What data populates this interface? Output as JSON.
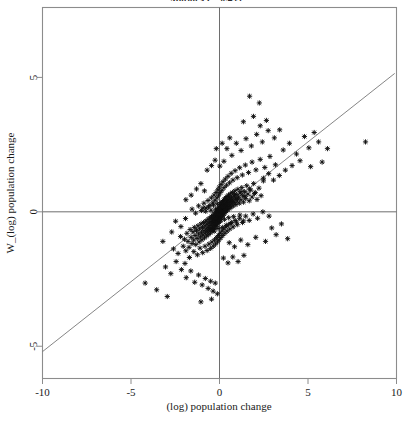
{
  "figure": {
    "title_clipped": "Moran's I = 0.433",
    "background": "#ffffff",
    "frame_color": "#8c8c8c",
    "marker_color": "#101010",
    "line_color": "#777777"
  },
  "chart_data": {
    "type": "scatter",
    "title": "Moran's I = 0.433",
    "xlabel": "(log) population change",
    "ylabel": "W_(log) population change",
    "xlim": [
      -10,
      10
    ],
    "ylim": [
      -6.2,
      7.6
    ],
    "xticks": [
      -10,
      -5,
      0,
      5,
      10
    ],
    "xticklabels": [
      "-10",
      "-5",
      "0",
      "5",
      "10"
    ],
    "yticks": [
      5,
      0,
      -5
    ],
    "yticklabels": [
      "5",
      "0",
      "-5"
    ],
    "grid": false,
    "legend": null,
    "reference_lines": [
      {
        "name": "vertical-zero-line",
        "orientation": "vertical",
        "value": 0
      },
      {
        "name": "horizontal-zero-line",
        "orientation": "horizontal",
        "value": 0
      }
    ],
    "fit_line": {
      "name": "moran-regression-line",
      "slope": 0.52,
      "intercept": 0.0,
      "x_endpoints": [
        -10.2,
        9.9
      ],
      "y_endpoints": [
        -5.3,
        5.15
      ]
    },
    "marker": {
      "style": "asterisk",
      "size": 4
    },
    "n_points": 620,
    "points": [
      [
        -2.6,
        -1.38
      ],
      [
        -2.34,
        -1.55
      ],
      [
        -2.2,
        -0.92
      ],
      [
        -2.05,
        -1.28
      ],
      [
        -1.98,
        -1.02
      ],
      [
        -1.9,
        -1.45
      ],
      [
        -1.84,
        -0.8
      ],
      [
        -1.78,
        -1.1
      ],
      [
        -1.72,
        -1.32
      ],
      [
        -1.66,
        -0.66
      ],
      [
        -1.6,
        -0.95
      ],
      [
        -1.55,
        -1.18
      ],
      [
        -1.5,
        -0.74
      ],
      [
        -1.46,
        -1.05
      ],
      [
        -1.42,
        -0.58
      ],
      [
        -1.38,
        -0.88
      ],
      [
        -1.34,
        -1.22
      ],
      [
        -1.3,
        -0.7
      ],
      [
        -1.26,
        -0.99
      ],
      [
        -1.22,
        -0.52
      ],
      [
        -1.18,
        -0.82
      ],
      [
        -1.15,
        -1.12
      ],
      [
        -1.12,
        -0.64
      ],
      [
        -1.08,
        -0.93
      ],
      [
        -1.05,
        -0.45
      ],
      [
        -1.02,
        -0.76
      ],
      [
        -0.99,
        -1.04
      ],
      [
        -0.96,
        -0.58
      ],
      [
        -0.93,
        -0.86
      ],
      [
        -0.9,
        -0.4
      ],
      [
        -0.88,
        -0.7
      ],
      [
        -0.85,
        -0.97
      ],
      [
        -0.82,
        -0.52
      ],
      [
        -0.8,
        -0.79
      ],
      [
        -0.77,
        -0.34
      ],
      [
        -0.75,
        -0.63
      ],
      [
        -0.72,
        -0.9
      ],
      [
        -0.7,
        -0.46
      ],
      [
        -0.68,
        -0.73
      ],
      [
        -0.65,
        -0.28
      ],
      [
        -0.63,
        -0.57
      ],
      [
        -0.61,
        -0.84
      ],
      [
        -0.59,
        -0.41
      ],
      [
        -0.57,
        -0.67
      ],
      [
        -0.55,
        -0.23
      ],
      [
        -0.53,
        -0.51
      ],
      [
        -0.51,
        -0.78
      ],
      [
        -0.49,
        -0.36
      ],
      [
        -0.47,
        -0.61
      ],
      [
        -0.45,
        -0.18
      ],
      [
        -0.44,
        -0.45
      ],
      [
        -0.42,
        -0.72
      ],
      [
        -0.4,
        -0.31
      ],
      [
        -0.39,
        -0.56
      ],
      [
        -0.37,
        -0.13
      ],
      [
        -0.36,
        -0.4
      ],
      [
        -0.34,
        -0.66
      ],
      [
        -0.33,
        -0.26
      ],
      [
        -0.31,
        -0.5
      ],
      [
        -0.3,
        -0.08
      ],
      [
        -0.29,
        -0.35
      ],
      [
        -0.27,
        -0.6
      ],
      [
        -0.26,
        -0.21
      ],
      [
        -0.25,
        -0.45
      ],
      [
        -0.23,
        -0.03
      ],
      [
        -0.22,
        -0.3
      ],
      [
        -0.21,
        -0.54
      ],
      [
        -0.2,
        -0.16
      ],
      [
        -0.19,
        -0.4
      ],
      [
        -0.17,
        0.02
      ],
      [
        -0.16,
        -0.25
      ],
      [
        -0.15,
        -0.49
      ],
      [
        -0.14,
        -0.11
      ],
      [
        -0.13,
        -0.35
      ],
      [
        -0.12,
        0.07
      ],
      [
        -0.11,
        -0.2
      ],
      [
        -0.1,
        -0.43
      ],
      [
        -0.09,
        -0.06
      ],
      [
        -0.08,
        -0.3
      ],
      [
        -0.07,
        0.12
      ],
      [
        -0.06,
        -0.15
      ],
      [
        -0.05,
        -0.38
      ],
      [
        -0.04,
        -0.01
      ],
      [
        -0.03,
        -0.25
      ],
      [
        -0.02,
        0.17
      ],
      [
        -0.01,
        -0.1
      ],
      [
        0.0,
        -0.33
      ],
      [
        0.01,
        0.04
      ],
      [
        0.02,
        -0.2
      ],
      [
        0.03,
        0.22
      ],
      [
        0.04,
        -0.05
      ],
      [
        0.05,
        -0.28
      ],
      [
        0.06,
        0.09
      ],
      [
        0.07,
        -0.15
      ],
      [
        0.08,
        0.27
      ],
      [
        0.09,
        0.0
      ],
      [
        0.1,
        -0.23
      ],
      [
        0.11,
        0.14
      ],
      [
        0.12,
        -0.1
      ],
      [
        0.13,
        0.32
      ],
      [
        0.14,
        0.05
      ],
      [
        0.15,
        -0.18
      ],
      [
        0.16,
        0.19
      ],
      [
        0.17,
        -0.05
      ],
      [
        0.18,
        0.37
      ],
      [
        0.19,
        0.1
      ],
      [
        0.2,
        -0.13
      ],
      [
        0.21,
        0.24
      ],
      [
        0.22,
        0.0
      ],
      [
        0.23,
        0.42
      ],
      [
        0.24,
        0.15
      ],
      [
        0.25,
        -0.08
      ],
      [
        0.26,
        0.29
      ],
      [
        0.28,
        0.05
      ],
      [
        0.29,
        0.47
      ],
      [
        0.3,
        0.2
      ],
      [
        0.31,
        -0.03
      ],
      [
        0.33,
        0.34
      ],
      [
        0.34,
        0.1
      ],
      [
        0.35,
        0.52
      ],
      [
        0.37,
        0.25
      ],
      [
        0.38,
        0.02
      ],
      [
        0.4,
        0.39
      ],
      [
        0.41,
        0.15
      ],
      [
        0.43,
        0.57
      ],
      [
        0.44,
        0.3
      ],
      [
        0.46,
        0.07
      ],
      [
        0.48,
        0.44
      ],
      [
        0.49,
        0.2
      ],
      [
        0.51,
        0.62
      ],
      [
        0.53,
        0.35
      ],
      [
        0.55,
        0.12
      ],
      [
        0.57,
        0.49
      ],
      [
        0.59,
        0.25
      ],
      [
        0.61,
        0.67
      ],
      [
        0.63,
        0.4
      ],
      [
        0.65,
        0.17
      ],
      [
        0.68,
        0.54
      ],
      [
        0.7,
        0.3
      ],
      [
        0.73,
        0.72
      ],
      [
        0.75,
        0.45
      ],
      [
        0.78,
        0.22
      ],
      [
        0.81,
        0.59
      ],
      [
        0.84,
        0.35
      ],
      [
        0.87,
        0.78
      ],
      [
        0.9,
        0.5
      ],
      [
        0.93,
        0.27
      ],
      [
        0.97,
        0.64
      ],
      [
        1.0,
        0.4
      ],
      [
        1.04,
        0.84
      ],
      [
        1.08,
        0.55
      ],
      [
        1.12,
        0.32
      ],
      [
        1.16,
        0.7
      ],
      [
        1.21,
        0.45
      ],
      [
        1.26,
        0.9
      ],
      [
        1.31,
        0.6
      ],
      [
        1.36,
        0.36
      ],
      [
        1.42,
        0.75
      ],
      [
        1.48,
        0.5
      ],
      [
        1.54,
        0.97
      ],
      [
        1.61,
        0.66
      ],
      [
        1.68,
        0.41
      ],
      [
        1.76,
        0.81
      ],
      [
        1.84,
        0.55
      ],
      [
        1.93,
        1.05
      ],
      [
        2.02,
        0.72
      ],
      [
        2.12,
        0.46
      ],
      [
        2.23,
        0.88
      ],
      [
        2.35,
        0.6
      ],
      [
        2.48,
        1.15
      ],
      [
        -1.95,
        -1.92
      ],
      [
        -1.7,
        -1.7
      ],
      [
        -1.45,
        -1.48
      ],
      [
        -1.25,
        -1.6
      ],
      [
        -1.1,
        -1.35
      ],
      [
        -0.95,
        -1.52
      ],
      [
        -0.82,
        -1.28
      ],
      [
        -0.7,
        -1.44
      ],
      [
        -0.6,
        -1.2
      ],
      [
        -0.5,
        -1.36
      ],
      [
        -0.42,
        -1.12
      ],
      [
        -0.35,
        -1.28
      ],
      [
        -0.28,
        -1.04
      ],
      [
        -0.22,
        -1.2
      ],
      [
        -0.16,
        -0.96
      ],
      [
        -0.11,
        -1.12
      ],
      [
        -0.06,
        -0.88
      ],
      [
        -0.02,
        -1.04
      ],
      [
        0.03,
        -0.8
      ],
      [
        0.08,
        -0.96
      ],
      [
        0.13,
        -0.72
      ],
      [
        0.18,
        -0.88
      ],
      [
        0.24,
        -0.64
      ],
      [
        0.3,
        -0.8
      ],
      [
        0.36,
        -0.56
      ],
      [
        0.43,
        -0.72
      ],
      [
        0.5,
        -0.48
      ],
      [
        0.58,
        -0.64
      ],
      [
        0.67,
        -0.4
      ],
      [
        0.77,
        -0.56
      ],
      [
        0.88,
        -0.32
      ],
      [
        1.0,
        -0.48
      ],
      [
        1.14,
        -0.24
      ],
      [
        1.3,
        -0.4
      ],
      [
        1.48,
        -0.16
      ],
      [
        1.68,
        -0.32
      ],
      [
        1.9,
        -0.08
      ],
      [
        2.15,
        -0.24
      ],
      [
        2.45,
        0.0
      ],
      [
        2.8,
        -0.16
      ],
      [
        -1.55,
        0.1
      ],
      [
        -1.35,
        -0.05
      ],
      [
        -1.18,
        0.22
      ],
      [
        -1.02,
        0.05
      ],
      [
        -0.88,
        0.32
      ],
      [
        -0.76,
        0.14
      ],
      [
        -0.65,
        0.42
      ],
      [
        -0.55,
        0.24
      ],
      [
        -0.46,
        0.52
      ],
      [
        -0.38,
        0.33
      ],
      [
        -0.31,
        0.62
      ],
      [
        -0.25,
        0.43
      ],
      [
        -0.19,
        0.72
      ],
      [
        -0.14,
        0.52
      ],
      [
        -0.09,
        0.82
      ],
      [
        -0.05,
        0.62
      ],
      [
        -0.01,
        0.92
      ],
      [
        0.04,
        0.71
      ],
      [
        0.09,
        1.02
      ],
      [
        0.14,
        0.8
      ],
      [
        0.2,
        1.12
      ],
      [
        0.26,
        0.9
      ],
      [
        0.33,
        1.22
      ],
      [
        0.4,
        0.99
      ],
      [
        0.48,
        1.32
      ],
      [
        0.57,
        1.08
      ],
      [
        0.66,
        1.43
      ],
      [
        0.76,
        1.18
      ],
      [
        0.88,
        1.53
      ],
      [
        1.0,
        1.27
      ],
      [
        1.14,
        1.64
      ],
      [
        1.29,
        1.37
      ],
      [
        1.46,
        1.74
      ],
      [
        1.64,
        1.46
      ],
      [
        1.84,
        1.85
      ],
      [
        2.06,
        1.56
      ],
      [
        2.3,
        1.95
      ],
      [
        2.56,
        1.65
      ],
      [
        2.85,
        2.06
      ],
      [
        3.16,
        1.75
      ],
      [
        0.42,
        2.35
      ],
      [
        0.7,
        2.1
      ],
      [
        0.95,
        2.55
      ],
      [
        1.22,
        2.28
      ],
      [
        1.5,
        2.72
      ],
      [
        1.8,
        2.45
      ],
      [
        2.1,
        2.88
      ],
      [
        2.42,
        2.6
      ],
      [
        2.75,
        3.02
      ],
      [
        3.1,
        2.75
      ],
      [
        1.35,
        3.35
      ],
      [
        1.92,
        3.55
      ],
      [
        2.3,
        3.2
      ],
      [
        2.65,
        3.4
      ],
      [
        3.4,
        3.05
      ],
      [
        1.7,
        4.3
      ],
      [
        2.25,
        4.05
      ],
      [
        3.6,
        2.3
      ],
      [
        3.95,
        2.55
      ],
      [
        4.35,
        2.15
      ],
      [
        5.05,
        2.38
      ],
      [
        5.6,
        2.6
      ],
      [
        8.25,
        2.6
      ],
      [
        -3.05,
        -2.05
      ],
      [
        -2.75,
        -2.3
      ],
      [
        -2.45,
        -1.85
      ],
      [
        -2.15,
        -2.15
      ],
      [
        -1.88,
        -2.45
      ],
      [
        -1.62,
        -2.2
      ],
      [
        -1.4,
        -2.62
      ],
      [
        -1.18,
        -2.35
      ],
      [
        -0.98,
        -2.72
      ],
      [
        -0.8,
        -2.48
      ],
      [
        -0.64,
        -2.85
      ],
      [
        -0.5,
        -2.58
      ],
      [
        -0.36,
        -2.95
      ],
      [
        -0.24,
        -2.65
      ],
      [
        -0.12,
        -3.05
      ],
      [
        0.22,
        -1.72
      ],
      [
        0.48,
        -1.9
      ],
      [
        0.75,
        -1.68
      ],
      [
        1.05,
        -1.85
      ],
      [
        1.38,
        -1.62
      ],
      [
        -4.2,
        -2.65
      ],
      [
        -3.55,
        -2.9
      ],
      [
        -2.95,
        -3.15
      ],
      [
        -1.05,
        -3.35
      ],
      [
        -0.45,
        -3.25
      ],
      [
        0.55,
        -1.15
      ],
      [
        0.85,
        -1.3
      ],
      [
        1.2,
        -1.05
      ],
      [
        1.6,
        -1.22
      ],
      [
        2.05,
        -0.95
      ],
      [
        2.6,
        -1.1
      ],
      [
        3.2,
        -0.85
      ],
      [
        3.85,
        -1.0
      ],
      [
        2.95,
        -0.6
      ],
      [
        3.5,
        -0.45
      ],
      [
        -0.7,
        1.55
      ],
      [
        -0.45,
        1.72
      ],
      [
        -0.25,
        1.92
      ],
      [
        0.02,
        1.7
      ],
      [
        0.25,
        1.88
      ],
      [
        -1.3,
        0.85
      ],
      [
        -1.05,
        1.05
      ],
      [
        -0.85,
        0.78
      ],
      [
        -1.6,
        0.62
      ],
      [
        -1.9,
        0.45
      ],
      [
        0.58,
        2.75
      ],
      [
        0.15,
        2.55
      ],
      [
        -0.18,
        2.35
      ],
      [
        2.48,
        1.25
      ],
      [
        2.78,
        1.42
      ],
      [
        3.05,
        1.18
      ],
      [
        3.38,
        1.35
      ],
      [
        3.72,
        1.55
      ],
      [
        4.1,
        1.72
      ],
      [
        4.55,
        1.9
      ],
      [
        5.15,
        1.68
      ],
      [
        5.8,
        1.85
      ],
      [
        4.8,
        2.8
      ],
      [
        5.35,
        2.95
      ],
      [
        6.1,
        2.35
      ],
      [
        -2.48,
        -0.35
      ],
      [
        -2.18,
        -0.55
      ],
      [
        -1.92,
        -0.25
      ],
      [
        -2.7,
        -0.75
      ],
      [
        -3.2,
        -1.1
      ],
      [
        -0.55,
        -0.65
      ],
      [
        -0.42,
        -0.22
      ],
      [
        -0.3,
        -0.72
      ],
      [
        -0.18,
        -0.42
      ],
      [
        -0.08,
        -0.62
      ],
      [
        0.06,
        -0.35
      ],
      [
        0.16,
        -0.58
      ],
      [
        0.28,
        -0.28
      ],
      [
        0.38,
        -0.5
      ],
      [
        0.52,
        -0.22
      ],
      [
        0.64,
        -0.44
      ],
      [
        0.8,
        -0.18
      ],
      [
        0.96,
        -0.38
      ],
      [
        1.15,
        -0.12
      ],
      [
        1.35,
        -0.34
      ],
      [
        -0.92,
        0.15
      ],
      [
        -0.78,
        0.02
      ],
      [
        -0.62,
        0.18
      ],
      [
        -0.48,
        0.06
      ],
      [
        -0.34,
        0.25
      ],
      [
        -0.22,
        0.1
      ],
      [
        -0.12,
        0.3
      ],
      [
        -0.02,
        0.15
      ],
      [
        0.08,
        0.35
      ],
      [
        0.18,
        0.2
      ],
      [
        0.3,
        0.45
      ],
      [
        0.42,
        0.28
      ],
      [
        0.55,
        0.55
      ],
      [
        0.7,
        0.38
      ],
      [
        0.85,
        0.65
      ],
      [
        1.02,
        0.48
      ],
      [
        1.22,
        0.75
      ],
      [
        1.44,
        0.58
      ],
      [
        1.7,
        0.85
      ],
      [
        1.98,
        0.68
      ]
    ]
  }
}
